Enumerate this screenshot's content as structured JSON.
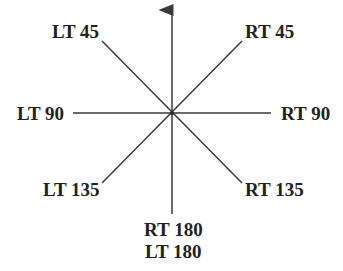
{
  "diagram": {
    "title": "",
    "center": {
      "x": 172,
      "y": 113
    },
    "line_color": "#3a3a3a",
    "labels": {
      "lt45": "LT 45",
      "rt45": "RT 45",
      "lt90": "LT 90",
      "rt90": "RT 90",
      "lt135": "LT 135",
      "rt135": "RT 135",
      "rt180": "RT 180",
      "lt180": "LT 180"
    }
  }
}
